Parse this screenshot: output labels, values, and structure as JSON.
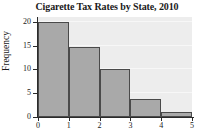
{
  "chart_data": {
    "type": "bar",
    "title": "Cigarette Tax Rates by State, 2010",
    "xlabel": "",
    "ylabel": "Frequency",
    "categories": [
      "0-1",
      "1-2",
      "2-3",
      "3-4",
      "4-5"
    ],
    "values": [
      20,
      14.7,
      10,
      3.8,
      1
    ],
    "bin_edges": [
      0,
      1,
      2,
      3,
      4,
      5
    ],
    "xlim": [
      0,
      5
    ],
    "ylim": [
      0,
      21
    ],
    "xticks": [
      "0",
      "1",
      "2",
      "3",
      "4",
      "5"
    ],
    "yticks": [
      "0",
      "5",
      "10",
      "15",
      "20"
    ],
    "grid": true,
    "legend": "none",
    "colors": {
      "bar_fill": "#a9a9a9",
      "bar_edge": "#4a4a4a",
      "plot_background": "#ededed",
      "gridline": "#f7f7f7",
      "axis": "#2b2b2b",
      "text": "#1a1a1a",
      "page_background": "#ffffff"
    }
  }
}
